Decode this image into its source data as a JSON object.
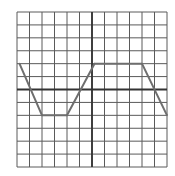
{
  "chart_data": {
    "type": "line",
    "title": "",
    "xlabel": "",
    "ylabel": "",
    "grid": true,
    "x_divisions": 12,
    "y_divisions": 12,
    "xlim": [
      -6,
      6
    ],
    "ylim": [
      -6,
      6
    ],
    "axes_through_origin": true,
    "series": [
      {
        "name": "trapezoidal-wave",
        "x": [
          -5.8,
          -4,
          -2,
          0.2,
          4,
          6
        ],
        "y": [
          2,
          -2,
          -2,
          2,
          2,
          -2
        ]
      }
    ]
  },
  "colors": {
    "grid": "#5a5a5a",
    "axis": "#333333",
    "wave": "#6e6e6e",
    "background": "#ffffff"
  }
}
